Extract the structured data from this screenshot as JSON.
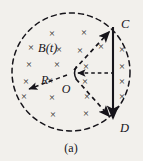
{
  "figure": {
    "caption": "(a)",
    "background_color": "#f2f0ec",
    "ink_color": "#16141a",
    "labels": {
      "field": "B(t)",
      "radius": "R",
      "center": "O",
      "top_point": "C",
      "bottom_point": "D"
    },
    "field_symbol": "×",
    "field_marks": [
      {
        "x": 52,
        "y": 33
      },
      {
        "x": 84,
        "y": 32
      },
      {
        "x": 31,
        "y": 47
      },
      {
        "x": 59,
        "y": 49
      },
      {
        "x": 80,
        "y": 50
      },
      {
        "x": 101,
        "y": 46
      },
      {
        "x": 122,
        "y": 49
      },
      {
        "x": 29,
        "y": 64
      },
      {
        "x": 57,
        "y": 64
      },
      {
        "x": 86,
        "y": 66
      },
      {
        "x": 122,
        "y": 66
      },
      {
        "x": 26,
        "y": 81
      },
      {
        "x": 50,
        "y": 80
      },
      {
        "x": 85,
        "y": 81
      },
      {
        "x": 122,
        "y": 81
      },
      {
        "x": 24,
        "y": 96
      },
      {
        "x": 52,
        "y": 97
      },
      {
        "x": 87,
        "y": 96
      },
      {
        "x": 122,
        "y": 96
      },
      {
        "x": 53,
        "y": 114
      },
      {
        "x": 86,
        "y": 113
      }
    ],
    "circle": {
      "cx": 71,
      "cy": 72,
      "r": 59,
      "style": "dashed"
    },
    "chord": {
      "x": 113,
      "y_top": 27,
      "y_bottom": 121,
      "style": "solid",
      "arrow": "down"
    },
    "radius_vectors": [
      {
        "name": "OC",
        "x1": 74,
        "y1": 70,
        "x2": 110,
        "y2": 31,
        "style": "dashed",
        "arrow": "end"
      },
      {
        "name": "OD",
        "x1": 76,
        "y1": 79,
        "x2": 110,
        "y2": 117,
        "style": "dashed",
        "arrow": "end"
      },
      {
        "name": "OR",
        "x1": 67,
        "y1": 75,
        "x2": 28,
        "y2": 90,
        "style": "dashed",
        "arrow": "end"
      },
      {
        "name": "O-horizontal",
        "x1": 76,
        "y1": 73,
        "x2": 112,
        "y2": 73,
        "style": "dashed",
        "arrow": "start"
      }
    ]
  }
}
